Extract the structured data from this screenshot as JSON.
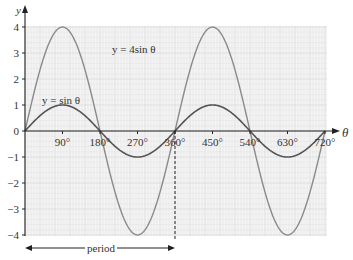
{
  "chart_data": {
    "type": "line",
    "title": "",
    "xlabel": "θ",
    "ylabel": "y",
    "x_ticks": [
      "90°",
      "180°",
      "270°",
      "360°",
      "450°",
      "540°",
      "630°",
      "720°"
    ],
    "y_ticks": [
      "4",
      "3",
      "2",
      "1",
      "0",
      "−1",
      "−2",
      "−3",
      "−4"
    ],
    "xlim": [
      0,
      720
    ],
    "ylim": [
      -4,
      4
    ],
    "grid": true,
    "series": [
      {
        "name": "y = 4sinθ",
        "amplitude": 4,
        "x": [
          0,
          90,
          180,
          270,
          360,
          450,
          540,
          630,
          720
        ],
        "values": [
          0,
          4,
          0,
          -4,
          0,
          4,
          0,
          -4,
          0
        ],
        "color": "#8a8a8a"
      },
      {
        "name": "y = sinθ",
        "amplitude": 1,
        "x": [
          0,
          90,
          180,
          270,
          360,
          450,
          540,
          630,
          720
        ],
        "values": [
          0,
          1,
          0,
          -1,
          0,
          1,
          0,
          -1,
          0
        ],
        "color": "#555555"
      }
    ],
    "annotations": [
      {
        "text": "period",
        "from": 0,
        "to": 360,
        "type": "double-arrow"
      },
      {
        "text": "",
        "x": 360,
        "type": "dashed-vertical-line"
      }
    ]
  },
  "labels": {
    "curve_4sin": "y = 4sin θ",
    "curve_sin": "y = sin θ",
    "period": "period",
    "y_axis": "y",
    "x_axis": "θ"
  }
}
